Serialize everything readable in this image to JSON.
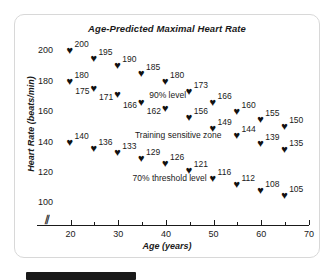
{
  "panel": {
    "title": "Age-Predicted Maximal Heart Rate"
  },
  "axes": {
    "x_title": "Age (years)",
    "y_title": "Heart Rate (beats/min)",
    "x_ticks": [
      "20",
      "30",
      "40",
      "50",
      "60",
      "70"
    ],
    "y_ticks": [
      "200",
      "180",
      "160",
      "140",
      "120",
      "100"
    ],
    "break_symbol": "⫽"
  },
  "annotations": {
    "level_90": "90% level",
    "training_zone": "Training sensitive zone",
    "threshold_70": "70% threshold level"
  },
  "marker": {
    "glyph": "♥"
  },
  "chart_data": {
    "type": "scatter",
    "title": "Age-Predicted Maximal Heart Rate",
    "xlabel": "Age (years)",
    "ylabel": "Heart Rate (beats/min)",
    "xlim": [
      18,
      70
    ],
    "ylim": [
      95,
      208
    ],
    "grid": false,
    "legend": "none",
    "x": [
      20,
      25,
      30,
      35,
      40,
      45,
      50,
      55,
      60,
      65
    ],
    "series": [
      {
        "name": "Maximal heart rate (100%)",
        "values": [
          200,
          195,
          190,
          185,
          180,
          173,
          166,
          160,
          155,
          150
        ],
        "label_side": [
          "right",
          "right",
          "right",
          "right",
          "right",
          "right",
          "right",
          "right",
          "right",
          "right"
        ]
      },
      {
        "name": "90% level",
        "values": [
          180,
          175,
          171,
          166,
          162,
          156,
          149,
          144,
          139,
          135
        ],
        "label_side": [
          "right",
          "left",
          "left",
          "left",
          "left",
          "right",
          "right",
          "right",
          "right",
          "right"
        ]
      },
      {
        "name": "70% threshold level",
        "values": [
          140,
          136,
          133,
          129,
          126,
          121,
          116,
          112,
          108,
          105
        ],
        "label_side": [
          "right",
          "right",
          "right",
          "right",
          "right",
          "right",
          "right",
          "right",
          "right",
          "right"
        ]
      }
    ],
    "annotations": [
      {
        "text": "90% level",
        "x": 36.5,
        "y": 171
      },
      {
        "text": "Training sensitive zone",
        "x": 33.5,
        "y": 145
      },
      {
        "text": "70% threshold level",
        "x": 33.0,
        "y": 117
      }
    ]
  }
}
